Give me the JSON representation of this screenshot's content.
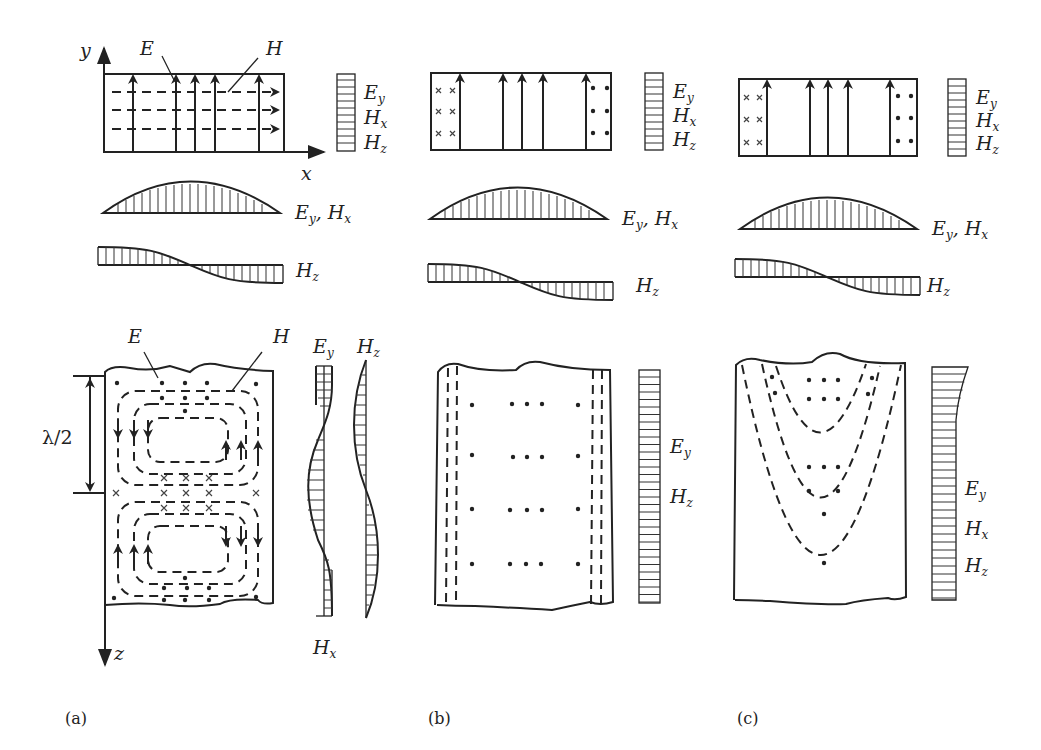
{
  "figure": {
    "panels": [
      {
        "id": "a",
        "caption": "(a)",
        "cross_section": {
          "axis_y_label": "y",
          "axis_x_label": "x",
          "callout_E": "E",
          "callout_H": "H",
          "bar_labels": [
            "E",
            "H",
            "H"
          ],
          "bar_label_subs": [
            "y",
            "x",
            "z"
          ]
        },
        "profile_1": {
          "label": "E",
          "label_sub": "y",
          "label_2": "H",
          "label_2_sub": "x",
          "shape": "half-sine"
        },
        "profile_2": {
          "label": "H",
          "label_sub": "z",
          "shape": "cosine"
        },
        "longitudinal": {
          "callout_E": "E",
          "callout_H": "H",
          "half_wavelength": "λ/2",
          "axis_z_label": "z",
          "profile_Ey": {
            "label": "E",
            "sub": "y"
          },
          "profile_Hz": {
            "label": "H",
            "sub": "z"
          },
          "profile_Hx": {
            "label": "H",
            "sub": "x"
          }
        }
      },
      {
        "id": "b",
        "caption": "(b)",
        "cross_section": {
          "bar_labels": [
            "E",
            "H",
            "H"
          ],
          "bar_label_subs": [
            "y",
            "x",
            "z"
          ]
        },
        "profile_1": {
          "label": "E",
          "label_sub": "y",
          "label_2": "H",
          "label_2_sub": "x",
          "shape": "half-sine"
        },
        "profile_2": {
          "label": "H",
          "label_sub": "z",
          "shape": "cosine"
        },
        "longitudinal": {
          "bar_labels": [
            "E",
            "H"
          ],
          "bar_label_subs": [
            "y",
            "z"
          ]
        }
      },
      {
        "id": "c",
        "caption": "(c)",
        "cross_section": {
          "bar_labels": [
            "E",
            "H",
            "H"
          ],
          "bar_label_subs": [
            "y",
            "x",
            "z"
          ]
        },
        "profile_1": {
          "label": "E",
          "label_sub": "y",
          "label_2": "H",
          "label_2_sub": "x",
          "shape": "half-sine"
        },
        "profile_2": {
          "label": "H",
          "label_sub": "z",
          "shape": "cosine"
        },
        "longitudinal": {
          "bar_labels": [
            "E",
            "H",
            "H"
          ],
          "bar_label_subs": [
            "y",
            "x",
            "z"
          ]
        }
      }
    ],
    "colors": {
      "ink": "#222222",
      "background": "#ffffff"
    }
  }
}
